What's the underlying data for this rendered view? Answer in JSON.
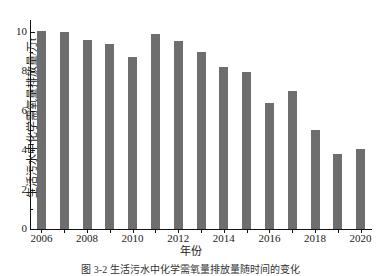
{
  "figure": {
    "caption": "图 3-2  生活污水中化学需氧量排放量随时间的变化"
  },
  "axes": {
    "ylabel": "生活污水中化学需氧量排放量/万t",
    "xlabel": "年份",
    "y_ticks": [
      "0",
      "2",
      "4",
      "6",
      "8",
      "10"
    ],
    "x_ticks": [
      "2006",
      "2008",
      "2010",
      "2012",
      "2014",
      "2016",
      "2018",
      "2020"
    ]
  },
  "style": {
    "bar_color": "#6e6e6e",
    "axis_color": "#111111",
    "background": "#ffffff"
  },
  "chart_data": {
    "type": "bar",
    "title": "",
    "subtitle": "",
    "xlabel": "年份",
    "ylabel": "生活污水中化学需氧量排放量/万t",
    "categories": [
      "2006",
      "2007",
      "2008",
      "2009",
      "2010",
      "2011",
      "2012",
      "2013",
      "2014",
      "2015",
      "2016",
      "2017",
      "2018",
      "2019",
      "2020"
    ],
    "values": [
      10.05,
      10.0,
      9.6,
      9.4,
      8.7,
      9.9,
      9.55,
      9.0,
      8.2,
      7.95,
      6.4,
      7.0,
      5.0,
      3.8,
      4.05
    ],
    "ylim": [
      0,
      10.6
    ],
    "ytick_values": [
      0,
      2,
      4,
      6,
      8,
      10
    ],
    "xtick_labels": [
      "2006",
      "2008",
      "2010",
      "2012",
      "2014",
      "2016",
      "2018",
      "2020"
    ],
    "grid": false,
    "legend": null,
    "legend_position": "none",
    "series": [
      {
        "name": "生活污水中化学需氧量排放量",
        "values": [
          10.05,
          10.0,
          9.6,
          9.4,
          8.7,
          9.9,
          9.55,
          9.0,
          8.2,
          7.95,
          6.4,
          7.0,
          5.0,
          3.8,
          4.05
        ]
      }
    ]
  }
}
